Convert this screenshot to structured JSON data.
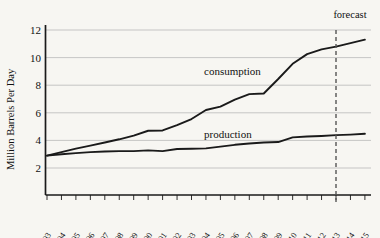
{
  "chart_data": {
    "type": "line",
    "title": "",
    "xlabel": "",
    "ylabel": "Million Barrels Per Day",
    "ylim": [
      0,
      12.6
    ],
    "yticks": [
      2,
      4,
      6,
      8,
      10,
      12
    ],
    "ytick_labels": [
      "2",
      "4",
      "6",
      "8",
      "10",
      "12"
    ],
    "grid": true,
    "legend": "inline-labels",
    "x": [
      1993,
      1994,
      1995,
      1996,
      1997,
      1998,
      1999,
      2000,
      2001,
      2002,
      2003,
      2004,
      2005,
      2006,
      2007,
      2008,
      2009,
      2010,
      2011,
      2012,
      2013,
      2014,
      2015
    ],
    "xtick_labels": [
      "1993",
      "1994",
      "1995",
      "1996",
      "1997",
      "1998",
      "1999",
      "2000",
      "2001",
      "2002",
      "2003",
      "2004",
      "2005",
      "2006",
      "2007",
      "2008",
      "2009",
      "2010",
      "2011",
      "2012",
      "2013",
      "2014",
      "2015"
    ],
    "series": [
      {
        "name": "consumption",
        "label": "consumption",
        "color": "#1a1a1a",
        "values": [
          2.9,
          3.15,
          3.4,
          3.62,
          3.85,
          4.08,
          4.35,
          4.7,
          4.72,
          5.1,
          5.55,
          6.2,
          6.45,
          6.95,
          7.35,
          7.4,
          8.45,
          9.55,
          10.25,
          10.6,
          10.8,
          11.05,
          11.3
        ]
      },
      {
        "name": "production",
        "label": "production",
        "color": "#1a1a1a",
        "values": [
          2.9,
          3.0,
          3.08,
          3.15,
          3.2,
          3.22,
          3.22,
          3.28,
          3.22,
          3.38,
          3.4,
          3.42,
          3.55,
          3.68,
          3.78,
          3.85,
          3.88,
          4.22,
          4.28,
          4.32,
          4.38,
          4.42,
          4.48
        ]
      }
    ],
    "annotations": [
      {
        "name": "forecast-divider",
        "label": "forecast",
        "x": 2013,
        "style": "dashed-vertical"
      }
    ]
  }
}
